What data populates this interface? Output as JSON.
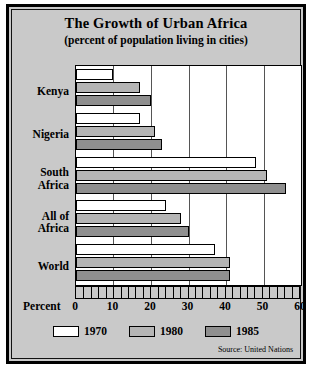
{
  "chart_data": {
    "type": "bar",
    "orientation": "horizontal",
    "title": "The Growth of Urban Africa",
    "subtitle": "(percent of population living in cities)",
    "xlabel": "Percent",
    "ylabel": "",
    "xlim": [
      0,
      60
    ],
    "xticks": [
      0,
      10,
      20,
      30,
      40,
      50,
      60
    ],
    "grid": true,
    "legend_position": "bottom",
    "categories": [
      "Kenya",
      "Nigeria",
      "South Africa",
      "All of Africa",
      "World"
    ],
    "category_labels": [
      [
        "Kenya"
      ],
      [
        "Nigeria"
      ],
      [
        "South",
        "Africa"
      ],
      [
        "All of",
        "Africa"
      ],
      [
        "World"
      ]
    ],
    "series": [
      {
        "name": "1970",
        "color": "#ffffff",
        "values": [
          10,
          17,
          48,
          24,
          37
        ]
      },
      {
        "name": "1980",
        "color": "#b5b5b5",
        "values": [
          17,
          21,
          51,
          28,
          41
        ]
      },
      {
        "name": "1985",
        "color": "#8f8f8f",
        "values": [
          20,
          23,
          56,
          30,
          41
        ]
      }
    ],
    "source": "Source: United Nations"
  },
  "legend": {
    "items": [
      {
        "label": "1970"
      },
      {
        "label": "1980"
      },
      {
        "label": "1985"
      }
    ]
  }
}
